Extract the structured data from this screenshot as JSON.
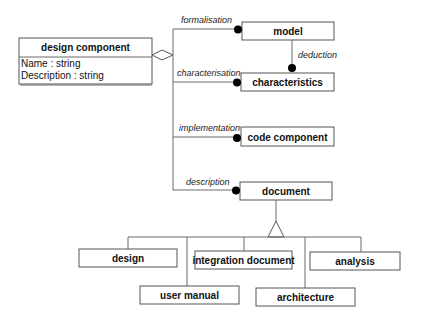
{
  "diagram": {
    "type": "UML class diagram",
    "main_class": {
      "name": "design component",
      "attributes": [
        "Name : string",
        "Description : string"
      ]
    },
    "aggregation_parts": [
      {
        "role": "formalisation",
        "class": "model"
      },
      {
        "role": "characterisation",
        "class": "characteristics"
      },
      {
        "role": "implementation",
        "class": "code component"
      },
      {
        "role": "description",
        "class": "document"
      }
    ],
    "association": {
      "from": "model",
      "to": "characteristics",
      "role": "deduction"
    },
    "generalization": {
      "parent": "document",
      "children": [
        "design",
        "user manual",
        "integration document",
        "architecture",
        "analysis"
      ]
    }
  }
}
